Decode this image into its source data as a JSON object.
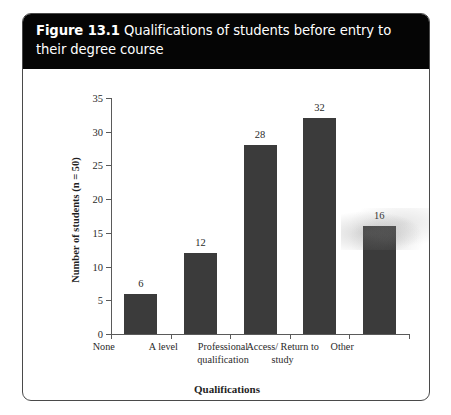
{
  "figure": {
    "number": "Figure 13.1",
    "caption": "Qualifications of students before entry to their degree course"
  },
  "chart_data": {
    "type": "bar",
    "title": "Figure 13.1 Qualifications of students before entry to their degree course",
    "categories": [
      "None",
      "A level",
      "Professional qualification",
      "Access/ Return to study",
      "Other"
    ],
    "values": [
      6,
      12,
      28,
      32,
      16
    ],
    "xlabel": "Qualifications",
    "ylabel": "Number of students (n = 50)",
    "ylim": [
      0,
      35
    ],
    "yticks": [
      "0",
      "5",
      "10",
      "15",
      "20",
      "25",
      "30",
      "35"
    ],
    "ytick_values": [
      0,
      5,
      10,
      15,
      20,
      25,
      30,
      35
    ],
    "grid": false,
    "legend": "none",
    "bar_color": "#3b3b3b",
    "axis_color": "#5a5a5a",
    "data_labels": [
      "6",
      "12",
      "28",
      "32",
      "16"
    ]
  },
  "artifacts": {
    "smudge_label": "scan-smudge"
  }
}
